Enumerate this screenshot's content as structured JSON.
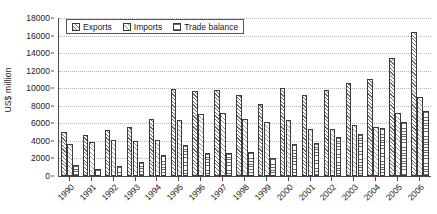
{
  "chart_data": {
    "type": "bar",
    "title": "",
    "subtitle": "",
    "xlabel": "",
    "ylabel": "US$ million",
    "ylim": [
      0,
      18000
    ],
    "ytick_step": 2000,
    "yticks": [
      0,
      2000,
      4000,
      6000,
      8000,
      10000,
      12000,
      14000,
      16000,
      18000
    ],
    "grid": "horizontal-dotted",
    "legend_position": "top-left-inside",
    "categories": [
      "1990",
      "1991",
      "1992",
      "1993",
      "1994",
      "1995",
      "1996",
      "1997",
      "1998",
      "1999",
      "2000",
      "2001",
      "2002",
      "2003",
      "2004",
      "2005",
      "2006"
    ],
    "series": [
      {
        "name": "Exports",
        "pattern": "diagonal-hatch",
        "values": [
          5000,
          4700,
          5200,
          5600,
          6500,
          9900,
          9700,
          9800,
          9200,
          8200,
          10000,
          9200,
          9800,
          10600,
          11100,
          13400,
          16400
        ]
      },
      {
        "name": "Imports",
        "pattern": "light-diagonal-hatch",
        "values": [
          3700,
          3900,
          4100,
          4000,
          4100,
          6400,
          7100,
          7200,
          6500,
          6100,
          6400,
          5400,
          5400,
          5800,
          5600,
          7200,
          9000
        ]
      },
      {
        "name": "Trade balance",
        "pattern": "horizontal-lines",
        "values": [
          1300,
          800,
          1100,
          1600,
          2400,
          3500,
          2600,
          2600,
          2700,
          2100,
          3600,
          3800,
          4400,
          4800,
          5500,
          6200,
          7400
        ]
      }
    ]
  },
  "legend": {
    "items": [
      {
        "label": "Exports"
      },
      {
        "label": "Imports"
      },
      {
        "label": "Trade balance"
      }
    ]
  },
  "axes": {
    "y_title": "US$ million"
  },
  "colors": {
    "axis": "#4a4a4a",
    "grid": "#b8b8b8",
    "bar_outline": "#3c3c3c",
    "background": "#ffffff",
    "text": "#1a1a1a"
  }
}
